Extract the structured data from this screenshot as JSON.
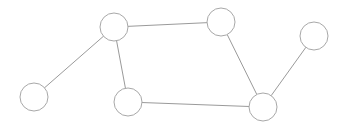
{
  "diagram": {
    "type": "undirected-graph",
    "style": {
      "background": "#ffffff",
      "edge_color": "#9a9a9a",
      "node_stroke": "#a8a8a8",
      "node_fill": "#ffffff",
      "node_radius": 14
    },
    "nodes": [
      {
        "id": "n1",
        "cx": 34,
        "cy": 97
      },
      {
        "id": "n2",
        "cx": 114,
        "cy": 27
      },
      {
        "id": "n3",
        "cx": 221,
        "cy": 22
      },
      {
        "id": "n4",
        "cx": 314,
        "cy": 36
      },
      {
        "id": "n5",
        "cx": 128,
        "cy": 102
      },
      {
        "id": "n6",
        "cx": 263,
        "cy": 107
      }
    ],
    "edges": [
      {
        "from": "n1",
        "to": "n2"
      },
      {
        "from": "n2",
        "to": "n3"
      },
      {
        "from": "n2",
        "to": "n5"
      },
      {
        "from": "n3",
        "to": "n6"
      },
      {
        "from": "n5",
        "to": "n6"
      },
      {
        "from": "n4",
        "to": "n6"
      }
    ]
  }
}
